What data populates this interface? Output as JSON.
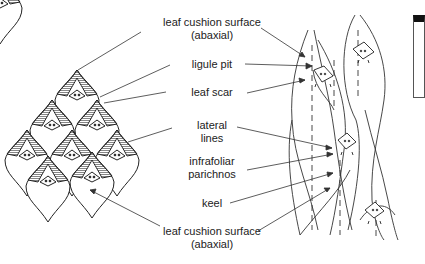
{
  "diagram": {
    "colors": {
      "line": "#333333",
      "text": "#222222",
      "hatch": "#444444",
      "background": "#ffffff"
    },
    "labels": [
      {
        "id": "leaf-cushion-surface-top",
        "lines": [
          "leaf cushion surface",
          "(abaxial)"
        ],
        "x": 212,
        "y": 22
      },
      {
        "id": "ligule-pit",
        "lines": [
          "ligule pit"
        ],
        "x": 212,
        "y": 64
      },
      {
        "id": "leaf-scar",
        "lines": [
          "leaf scar"
        ],
        "x": 212,
        "y": 90
      },
      {
        "id": "lateral-lines",
        "lines": [
          "lateral",
          "lines"
        ],
        "x": 212,
        "y": 123
      },
      {
        "id": "infrafoliar-parichnos",
        "lines": [
          "infrafoliar",
          "parichnos"
        ],
        "x": 212,
        "y": 158
      },
      {
        "id": "keel",
        "lines": [
          "keel"
        ],
        "x": 212,
        "y": 198
      },
      {
        "id": "leaf-cushion-surface-bottom",
        "lines": [
          "leaf cushion surface",
          "(abaxial)"
        ],
        "x": 212,
        "y": 230
      }
    ]
  }
}
